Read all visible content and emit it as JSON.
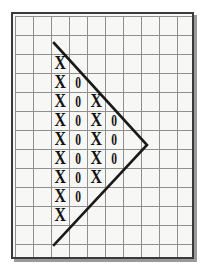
{
  "figure": {
    "background_color": "#ffffff"
  },
  "panel": {
    "name": "grid-panel",
    "x": 11,
    "y": 12,
    "width": 183,
    "height": 247,
    "fill_color": "#f7f7f5",
    "border_color": "#3a3a3a",
    "border_width": 2,
    "shadow_color": "#9a9a9a"
  },
  "grid": {
    "columns": 10,
    "rows": 13,
    "cell_width": 18,
    "cell_height": 19,
    "origin_x": 2,
    "origin_y": 2,
    "line_color": "#8f8f8f",
    "line_width": 1,
    "show_grid": true
  },
  "shape": {
    "name": "triangle-outline",
    "type": "polyline",
    "stroke_color": "#1a1a1a",
    "stroke_width": 2.6,
    "points": [
      {
        "x": 41,
        "y": 29
      },
      {
        "x": 134,
        "y": 131
      },
      {
        "x": 41,
        "y": 231
      }
    ],
    "vertex_labels": [
      "apex-top",
      "apex-right",
      "apex-bottom"
    ]
  },
  "cells": {
    "glyph_x": "X",
    "glyph_zero": "0",
    "rows": [
      {
        "row": 2,
        "values": [
          "X"
        ]
      },
      {
        "row": 3,
        "values": [
          "X",
          "0"
        ]
      },
      {
        "row": 4,
        "values": [
          "X",
          "0",
          "X"
        ]
      },
      {
        "row": 5,
        "values": [
          "X",
          "0",
          "X",
          "0"
        ]
      },
      {
        "row": 6,
        "values": [
          "X",
          "0",
          "X",
          "0"
        ]
      },
      {
        "row": 7,
        "values": [
          "X",
          "0",
          "X",
          "0"
        ]
      },
      {
        "row": 8,
        "values": [
          "X",
          "0",
          "X"
        ]
      },
      {
        "row": 9,
        "values": [
          "X",
          "0"
        ]
      },
      {
        "row": 10,
        "values": [
          "X"
        ]
      }
    ],
    "start_column": 2
  },
  "chart_data": {
    "type": "heatmap",
    "xlabel": "",
    "ylabel": "",
    "grid": true,
    "legend": [],
    "columns": 10,
    "rows": 13,
    "matrix": [
      [
        "",
        "",
        "",
        "",
        "",
        "",
        "",
        "",
        "",
        ""
      ],
      [
        "",
        "",
        "",
        "",
        "",
        "",
        "",
        "",
        "",
        ""
      ],
      [
        "",
        "",
        "X",
        "",
        "",
        "",
        "",
        "",
        "",
        ""
      ],
      [
        "",
        "",
        "X",
        "0",
        "",
        "",
        "",
        "",
        "",
        ""
      ],
      [
        "",
        "",
        "X",
        "0",
        "X",
        "",
        "",
        "",
        "",
        ""
      ],
      [
        "",
        "",
        "X",
        "0",
        "X",
        "0",
        "",
        "",
        "",
        ""
      ],
      [
        "",
        "",
        "X",
        "0",
        "X",
        "0",
        "",
        "",
        "",
        ""
      ],
      [
        "",
        "",
        "X",
        "0",
        "X",
        "0",
        "",
        "",
        "",
        ""
      ],
      [
        "",
        "",
        "X",
        "0",
        "X",
        "",
        "",
        "",
        "",
        ""
      ],
      [
        "",
        "",
        "X",
        "0",
        "",
        "",
        "",
        "",
        "",
        ""
      ],
      [
        "",
        "",
        "X",
        "",
        "",
        "",
        "",
        "",
        "",
        ""
      ],
      [
        "",
        "",
        "",
        "",
        "",
        "",
        "",
        "",
        "",
        ""
      ],
      [
        "",
        "",
        "",
        "",
        "",
        "",
        "",
        "",
        "",
        ""
      ]
    ],
    "overlay_polyline": [
      [
        41,
        29
      ],
      [
        134,
        131
      ],
      [
        41,
        231
      ]
    ]
  }
}
